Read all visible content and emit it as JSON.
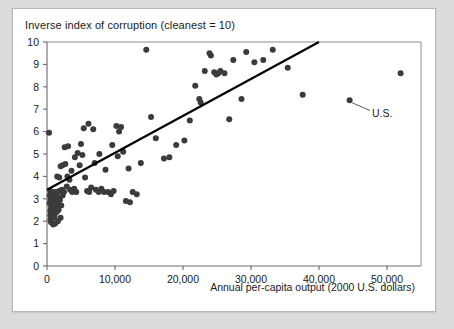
{
  "chart_data": {
    "type": "scatter",
    "title": "Inverse index of corruption (cleanest = 10)",
    "xlabel": "Annual per-capita output (2000 U.S. dollars)",
    "ylabel": "Inverse index of corruption (cleanest = 10)",
    "xlim": [
      0,
      55000
    ],
    "ylim": [
      0,
      10
    ],
    "xticks": [
      0,
      10000,
      20000,
      30000,
      40000,
      50000
    ],
    "xtick_labels": [
      "0",
      "10,000",
      "20,000",
      "30,000",
      "40,000",
      "50,000"
    ],
    "yticks": [
      0,
      1,
      2,
      3,
      4,
      5,
      6,
      7,
      8,
      9,
      10
    ],
    "ytick_labels": [
      "0",
      "1",
      "2",
      "3",
      "4",
      "5",
      "6",
      "7",
      "8",
      "9",
      "10"
    ],
    "grid": false,
    "legend": false,
    "marker_color": "#3b3b3b",
    "marker_size": 3.0,
    "trendline": {
      "label": "fitted regression line",
      "color": "#000000",
      "x_start": 0,
      "y_start": 3.4,
      "x_end": 40000,
      "y_end": 10.0
    },
    "annotations": [
      {
        "text": "U.S.",
        "point_x": 44500,
        "point_y": 7.4,
        "label_x": 47800,
        "label_y": 6.85
      }
    ],
    "points": [
      [
        300,
        5.95
      ],
      [
        500,
        2.05
      ],
      [
        500,
        2.25
      ],
      [
        500,
        2.45
      ],
      [
        600,
        2.6
      ],
      [
        400,
        2.8
      ],
      [
        500,
        2.95
      ],
      [
        600,
        3.05
      ],
      [
        400,
        3.15
      ],
      [
        700,
        3.25
      ],
      [
        500,
        3.35
      ],
      [
        800,
        3.3
      ],
      [
        600,
        1.95
      ],
      [
        900,
        2.15
      ],
      [
        700,
        2.35
      ],
      [
        1000,
        2.55
      ],
      [
        800,
        2.7
      ],
      [
        1100,
        2.85
      ],
      [
        900,
        3.0
      ],
      [
        1200,
        3.1
      ],
      [
        1000,
        3.2
      ],
      [
        1300,
        3.3
      ],
      [
        1100,
        2.2
      ],
      [
        1400,
        2.4
      ],
      [
        1200,
        2.6
      ],
      [
        1500,
        2.75
      ],
      [
        1300,
        2.9
      ],
      [
        1600,
        3.05
      ],
      [
        1400,
        3.2
      ],
      [
        1800,
        3.35
      ],
      [
        900,
        1.85
      ],
      [
        1200,
        1.9
      ],
      [
        1600,
        2.0
      ],
      [
        2000,
        2.15
      ],
      [
        1700,
        2.5
      ],
      [
        2100,
        2.7
      ],
      [
        1900,
        2.95
      ],
      [
        2300,
        3.15
      ],
      [
        2500,
        3.3
      ],
      [
        2200,
        3.4
      ],
      [
        1500,
        4.0
      ],
      [
        1800,
        3.95
      ],
      [
        2000,
        4.45
      ],
      [
        2300,
        4.5
      ],
      [
        2600,
        5.3
      ],
      [
        3100,
        5.35
      ],
      [
        2700,
        4.55
      ],
      [
        3000,
        4.0
      ],
      [
        3300,
        3.85
      ],
      [
        2900,
        3.55
      ],
      [
        3400,
        3.4
      ],
      [
        3700,
        3.3
      ],
      [
        4000,
        3.45
      ],
      [
        4300,
        3.3
      ],
      [
        3600,
        4.25
      ],
      [
        4100,
        4.85
      ],
      [
        4500,
        5.05
      ],
      [
        4800,
        4.5
      ],
      [
        5200,
        4.95
      ],
      [
        5000,
        5.45
      ],
      [
        5600,
        3.95
      ],
      [
        5900,
        3.35
      ],
      [
        6200,
        3.3
      ],
      [
        6500,
        3.5
      ],
      [
        5400,
        6.15
      ],
      [
        6100,
        6.35
      ],
      [
        6800,
        6.1
      ],
      [
        7200,
        3.4
      ],
      [
        7600,
        3.3
      ],
      [
        8000,
        3.45
      ],
      [
        8400,
        3.3
      ],
      [
        7000,
        4.6
      ],
      [
        7700,
        5.0
      ],
      [
        8600,
        4.3
      ],
      [
        9000,
        3.3
      ],
      [
        9400,
        3.2
      ],
      [
        9800,
        3.35
      ],
      [
        10200,
        6.25
      ],
      [
        10600,
        6.0
      ],
      [
        10900,
        6.2
      ],
      [
        9600,
        5.4
      ],
      [
        10400,
        4.9
      ],
      [
        11200,
        5.1
      ],
      [
        12000,
        4.35
      ],
      [
        12600,
        3.3
      ],
      [
        13200,
        3.2
      ],
      [
        11600,
        2.9
      ],
      [
        12200,
        2.85
      ],
      [
        13800,
        4.6
      ],
      [
        14600,
        9.65
      ],
      [
        15300,
        6.65
      ],
      [
        16000,
        5.7
      ],
      [
        17200,
        4.8
      ],
      [
        18000,
        4.85
      ],
      [
        19000,
        5.4
      ],
      [
        20200,
        5.6
      ],
      [
        21000,
        6.5
      ],
      [
        21800,
        8.05
      ],
      [
        22400,
        7.45
      ],
      [
        22600,
        7.3
      ],
      [
        23200,
        8.7
      ],
      [
        23900,
        9.5
      ],
      [
        24100,
        9.4
      ],
      [
        24600,
        8.65
      ],
      [
        24900,
        8.55
      ],
      [
        25200,
        8.6
      ],
      [
        25500,
        8.7
      ],
      [
        26100,
        8.6
      ],
      [
        26800,
        6.55
      ],
      [
        27400,
        9.2
      ],
      [
        28600,
        7.45
      ],
      [
        29300,
        9.55
      ],
      [
        30500,
        9.1
      ],
      [
        31800,
        9.2
      ],
      [
        33200,
        9.65
      ],
      [
        35400,
        8.85
      ],
      [
        37600,
        7.65
      ],
      [
        44500,
        7.4
      ],
      [
        52000,
        8.6
      ]
    ]
  }
}
